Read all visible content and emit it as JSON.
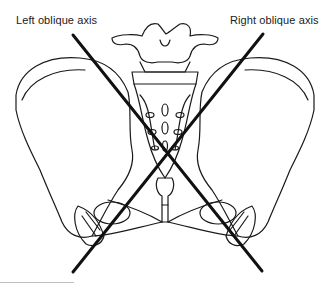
{
  "figure": {
    "labels": {
      "left_axis": "Left oblique axis",
      "right_axis": "Right oblique axis"
    },
    "axes": [
      {
        "name": "left-oblique-axis",
        "x1": 73,
        "y1": 35,
        "x2": 262,
        "y2": 271
      },
      {
        "name": "right-oblique-axis",
        "x1": 263,
        "y1": 34,
        "x2": 73,
        "y2": 272
      }
    ],
    "colors": {
      "line": "#111111",
      "outline": "#1a1a1a",
      "background": "#ffffff"
    }
  }
}
